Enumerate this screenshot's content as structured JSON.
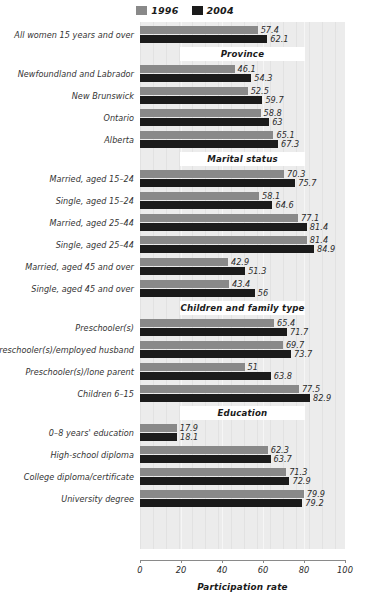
{
  "chart_data": {
    "type": "bar",
    "orientation": "horizontal",
    "title": "",
    "xlabel": "Participation rate",
    "ylabel": "",
    "xlim": [
      0,
      100
    ],
    "xticks": [
      0,
      20,
      40,
      60,
      80,
      100
    ],
    "grid": true,
    "legend_position": "top-center",
    "legend": [
      {
        "name": "1996",
        "color": "#898989"
      },
      {
        "name": "2004",
        "color": "#1b1b1b"
      }
    ],
    "series_names": [
      "1996",
      "2004"
    ],
    "sections": [
      {
        "header": null,
        "rows": [
          {
            "category": "All women 15 years and over",
            "values": [
              57.4,
              62.1
            ]
          }
        ]
      },
      {
        "header": "Province",
        "rows": [
          {
            "category": "Newfoundland and Labrador",
            "values": [
              46.1,
              54.3
            ]
          },
          {
            "category": "New Brunswick",
            "values": [
              52.5,
              59.7
            ]
          },
          {
            "category": "Ontario",
            "values": [
              58.8,
              63
            ]
          },
          {
            "category": "Alberta",
            "values": [
              65.1,
              67.3
            ]
          }
        ]
      },
      {
        "header": "Marital status",
        "rows": [
          {
            "category": "Married, aged 15–24",
            "values": [
              70.3,
              75.7
            ]
          },
          {
            "category": "Single, aged 15–24",
            "values": [
              58.1,
              64.6
            ]
          },
          {
            "category": "Married, aged 25–44",
            "values": [
              77.1,
              81.4
            ]
          },
          {
            "category": "Single, aged 25–44",
            "values": [
              81.4,
              84.9
            ]
          },
          {
            "category": "Married, aged 45 and over",
            "values": [
              42.9,
              51.3
            ]
          },
          {
            "category": "Single, aged 45 and over",
            "values": [
              43.4,
              56
            ]
          }
        ]
      },
      {
        "header": "Children and family type",
        "rows": [
          {
            "category": "Preschooler(s)",
            "values": [
              65.4,
              71.7
            ]
          },
          {
            "category": "Preschooler(s)/employed husband",
            "values": [
              69.7,
              73.7
            ]
          },
          {
            "category": "Preschooler(s)/lone parent",
            "values": [
              51,
              63.8
            ]
          },
          {
            "category": "Children 6–15",
            "values": [
              77.5,
              82.9
            ]
          }
        ]
      },
      {
        "header": "Education",
        "rows": [
          {
            "category": "0–8 years' education",
            "values": [
              17.9,
              18.1
            ]
          },
          {
            "category": "High-school diploma",
            "values": [
              62.3,
              63.7
            ]
          },
          {
            "category": "College diploma/certificate",
            "values": [
              71.3,
              72.9
            ]
          },
          {
            "category": "University degree",
            "values": [
              79.9,
              79.2
            ]
          }
        ]
      }
    ]
  },
  "colors": {
    "series_1996": "#898989",
    "series_2004": "#1b1b1b",
    "plot_background": "#e9e9e9",
    "band_background": "#ffffff",
    "axis": "#8a8a8a"
  }
}
